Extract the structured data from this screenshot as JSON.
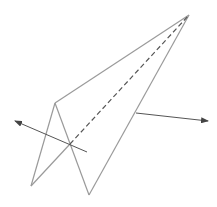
{
  "diagram": {
    "title": "",
    "colors": {
      "edge": "#9a9a9a",
      "dashed": "#555555",
      "arrow": "#555555"
    }
  }
}
